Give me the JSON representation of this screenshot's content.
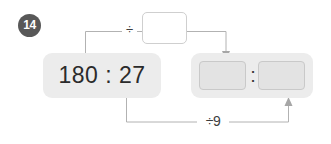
{
  "exercise": {
    "number_badge": "14",
    "badge_color": "#585858",
    "panel_color": "#ececec",
    "slot_color": "#e3e3e3",
    "line_color": "#b2b2b2"
  },
  "given_expression": {
    "left_term": "180",
    "separator": ":",
    "right_term": "27",
    "full_text": "180 : 27"
  },
  "top_input": {
    "value": "",
    "placeholder": ""
  },
  "answer": {
    "left_slot_value": "",
    "left_slot_placeholder": "",
    "separator": ":",
    "right_slot_value": "",
    "right_slot_placeholder": ""
  },
  "operators": {
    "top_label": "÷",
    "bottom_label": "÷9"
  }
}
